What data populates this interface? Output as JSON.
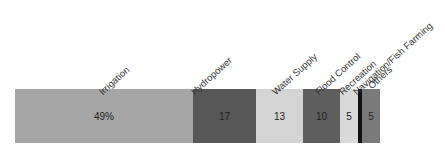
{
  "chart_data": {
    "type": "bar",
    "orientation": "horizontal-stacked",
    "title": "",
    "xlabel": "",
    "ylabel": "",
    "grid": false,
    "legend": "none",
    "units": "percent",
    "categories": [
      "Irrigation",
      "Hydropower",
      "Water Supply",
      "Flood Control",
      "Recreation",
      "Navigation/Fish Farming",
      "Others"
    ],
    "values": [
      49,
      17,
      13,
      10,
      5,
      1,
      5
    ],
    "data_labels": [
      "49%",
      "17",
      "13",
      "10",
      "5",
      "",
      "5"
    ],
    "colors": [
      "#a6a6a6",
      "#575757",
      "#d4d4d4",
      "#5e5e5e",
      "#d9d9d9",
      "#111111",
      "#7a7a7a"
    ]
  },
  "segments": [
    {
      "name": "Irrigation",
      "label": "49%",
      "left": 15,
      "width": 178,
      "color": "#a6a6a6",
      "labelLeft": 104,
      "labelTop": 86
    },
    {
      "name": "Hydropower",
      "label": "17",
      "left": 193,
      "width": 63,
      "color": "#575757",
      "labelLeft": 196,
      "labelTop": 86
    },
    {
      "name": "Water Supply",
      "label": "13",
      "left": 256,
      "width": 47,
      "color": "#d4d4d4",
      "labelLeft": 277,
      "labelTop": 86
    },
    {
      "name": "Flood Control",
      "label": "10",
      "left": 303,
      "width": 37,
      "color": "#5e5e5e",
      "labelLeft": 320,
      "labelTop": 86
    },
    {
      "name": "Recreation",
      "label": "5",
      "left": 340,
      "width": 18,
      "color": "#d9d9d9",
      "labelLeft": 344,
      "labelTop": 86
    },
    {
      "name": "Navigation/Fish Farming",
      "label": "",
      "left": 358,
      "width": 4,
      "color": "#111111",
      "labelLeft": 358,
      "labelTop": 86
    },
    {
      "name": "Others",
      "label": "5",
      "left": 362,
      "width": 18,
      "color": "#7a7a7a",
      "labelLeft": 373,
      "labelTop": 80
    }
  ]
}
